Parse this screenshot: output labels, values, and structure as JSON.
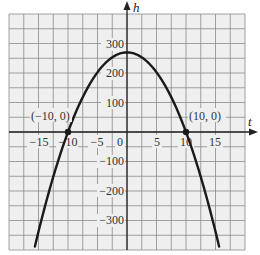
{
  "chart_data": {
    "type": "line",
    "title": "",
    "xlabel": "t",
    "ylabel": "h",
    "xlim": [
      -20,
      20
    ],
    "ylim": [
      -400,
      400
    ],
    "grid": true,
    "grid_step_x": 2.5,
    "grid_step_y": 50,
    "x_ticks": [
      -15,
      -10,
      -5,
      0,
      5,
      10,
      15
    ],
    "x_tick_labels": [
      "−15",
      "−10",
      "−5",
      "0",
      "5",
      "10",
      "15"
    ],
    "y_ticks": [
      300,
      200,
      100,
      -100,
      -200,
      -300
    ],
    "y_tick_labels": [
      "300",
      "200",
      "100",
      "−100",
      "−200",
      "−300"
    ],
    "series": [
      {
        "name": "h(t)",
        "equation": "h = 270 - 2.7 t^2",
        "x": [
          -15,
          -12.5,
          -10,
          -7.5,
          -5,
          -2.5,
          0,
          2.5,
          5,
          7.5,
          10,
          12.5,
          15
        ],
        "values": [
          -337.5,
          -151.9,
          0,
          118.1,
          202.5,
          253.1,
          270,
          253.1,
          202.5,
          118.1,
          0,
          -151.9,
          -337.5
        ]
      }
    ],
    "annotations": [
      {
        "label": "(−10, 0)",
        "x": -10,
        "y": 0
      },
      {
        "label": "(10, 0)",
        "x": 10,
        "y": 0
      }
    ]
  },
  "labels": {
    "x_axis": "t",
    "y_axis": "h",
    "point_left": "(−10, 0)",
    "point_right": "(10, 0)",
    "xt": [
      "−15",
      "−10",
      "−5",
      "0",
      "5",
      "10",
      "15"
    ],
    "yt": [
      "300",
      "200",
      "100",
      "−100",
      "−200",
      "−300"
    ]
  }
}
